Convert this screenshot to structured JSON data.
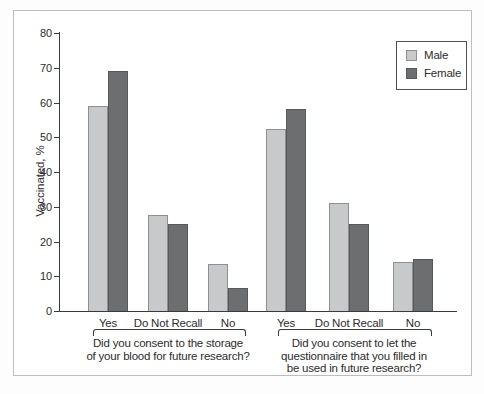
{
  "colors": {
    "male_fill": "#c8c9ca",
    "male_border": "#8f8f8f",
    "female_fill": "#6d6e70",
    "female_border": "#57585a",
    "axis": "#3a3a3c",
    "text": "#2c2c2c",
    "frame_border": "#bdbdbd",
    "legend_border": "#4f4f4f",
    "background": "#ffffff"
  },
  "legend": {
    "position": "top-right",
    "items": [
      {
        "label": "Male",
        "color_key": "male"
      },
      {
        "label": "Female",
        "color_key": "female"
      }
    ]
  },
  "chart_data": {
    "type": "bar",
    "title": "",
    "xlabel": "",
    "ylabel": "Vaccinated, %",
    "ylim": [
      0,
      80
    ],
    "yticks": [
      0,
      10,
      20,
      30,
      40,
      50,
      60,
      70,
      80
    ],
    "grid": false,
    "legend_position": "top-right",
    "series_names": [
      "Male",
      "Female"
    ],
    "groups": [
      {
        "question": "Did you consent to the storage of your blood for future research?",
        "question_lines": [
          "Did you consent to the storage",
          "of your blood for future research?"
        ],
        "categories": [
          "Yes",
          "Do Not Recall",
          "No"
        ],
        "series": [
          {
            "name": "Male",
            "values": [
              59,
              27.5,
              13.5
            ]
          },
          {
            "name": "Female",
            "values": [
              69,
              25,
              6.5
            ]
          }
        ]
      },
      {
        "question": "Did you consent to let the questionnaire that you filled in be used in future research?",
        "question_lines": [
          "Did you consent to let the",
          "questionnaire that you filled in",
          "be used in future research?"
        ],
        "categories": [
          "Yes",
          "Do Not Recall",
          "No"
        ],
        "series": [
          {
            "name": "Male",
            "values": [
              52.5,
              31,
              14
            ]
          },
          {
            "name": "Female",
            "values": [
              58,
              25,
              15
            ]
          }
        ]
      }
    ]
  }
}
